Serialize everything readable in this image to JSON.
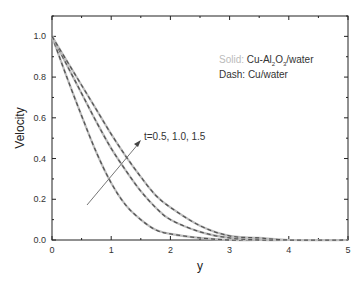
{
  "chart_data": {
    "type": "line",
    "title": "",
    "xlabel": "y",
    "ylabel": "Velocity",
    "xlim": [
      0,
      5
    ],
    "ylim": [
      0,
      1.1
    ],
    "xticks": [
      "0",
      "1",
      "2",
      "3",
      "4",
      "5"
    ],
    "yticks": [
      "0.0",
      "0.2",
      "0.4",
      "0.6",
      "0.8",
      "1.0"
    ],
    "grid": false,
    "legend": {
      "position": "upper right",
      "entries": [
        {
          "prefix": "Solid:",
          "label": "Cu-Al2O3/water",
          "style": "solid",
          "color": "#b8b8b8"
        },
        {
          "prefix": "Dash:",
          "label": "Cu/water",
          "style": "dashed",
          "color": "#555555"
        }
      ]
    },
    "annotation": {
      "text": "t=0.5, 1.0, 1.5",
      "arrow": "increasing t"
    },
    "x": [
      0,
      0.25,
      0.5,
      0.75,
      1.0,
      1.25,
      1.5,
      1.75,
      2.0,
      2.5,
      3.0,
      3.5,
      4.0,
      5.0
    ],
    "series": [
      {
        "name": "t=0.5",
        "values": [
          1.0,
          0.8,
          0.61,
          0.43,
          0.28,
          0.17,
          0.1,
          0.05,
          0.03,
          0.01,
          0.0,
          0.0,
          0.0,
          0.0
        ]
      },
      {
        "name": "t=1.0",
        "values": [
          1.0,
          0.86,
          0.72,
          0.58,
          0.45,
          0.34,
          0.24,
          0.16,
          0.1,
          0.04,
          0.01,
          0.0,
          0.0,
          0.0
        ]
      },
      {
        "name": "t=1.5",
        "values": [
          1.0,
          0.88,
          0.76,
          0.64,
          0.52,
          0.41,
          0.31,
          0.22,
          0.16,
          0.07,
          0.02,
          0.01,
          0.0,
          0.0
        ]
      }
    ]
  },
  "labels": {
    "xlabel": "y",
    "ylabel": "Velocity",
    "legend_solid_prefix": "Solid:",
    "legend_solid_text": "Cu-Al",
    "legend_solid_sub1": "2",
    "legend_solid_mid": "O",
    "legend_solid_sub2": "3",
    "legend_solid_end": "/water",
    "legend_dash": "Dash: Cu/water",
    "annotation": "t=0.5, 1.0, 1.5"
  }
}
